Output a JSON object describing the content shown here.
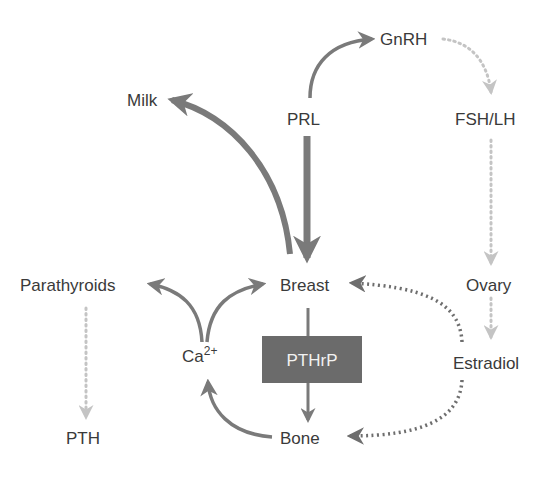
{
  "diagram": {
    "type": "hormonal-regulation-flow",
    "nodes": {
      "gnrh": {
        "label": "GnRH",
        "x": 388,
        "y": 46
      },
      "milk": {
        "label": "Milk",
        "x": 127,
        "y": 105
      },
      "prl": {
        "label": "PRL",
        "x": 287,
        "y": 124
      },
      "fsh_lh": {
        "label": "FSH/LH",
        "x": 455,
        "y": 124
      },
      "parathyroids": {
        "label": "Parathyroids",
        "x": 20,
        "y": 290
      },
      "breast": {
        "label": "Breast",
        "x": 282,
        "y": 290
      },
      "ovary": {
        "label": "Ovary",
        "x": 466,
        "y": 290
      },
      "ca": {
        "label": "Ca",
        "superscript": "2+",
        "x": 182,
        "y": 360
      },
      "pthrp": {
        "label": "PTHrP",
        "x": 262,
        "y": 336,
        "width": 100,
        "height": 47
      },
      "estradiol": {
        "label": "Estradiol",
        "x": 453,
        "y": 368
      },
      "pth": {
        "label": "PTH",
        "x": 66,
        "y": 443
      },
      "bone": {
        "label": "Bone",
        "x": 280,
        "y": 443
      }
    },
    "edges": [
      {
        "from": "PRL",
        "to": "GnRH",
        "style": "solid",
        "weight": "normal"
      },
      {
        "from": "GnRH",
        "to": "FSH/LH",
        "style": "dotted-light"
      },
      {
        "from": "FSH/LH",
        "to": "Ovary",
        "style": "dotted-light"
      },
      {
        "from": "Ovary",
        "to": "Estradiol",
        "style": "dotted-light"
      },
      {
        "from": "Breast",
        "to": "Milk",
        "style": "solid",
        "weight": "thick"
      },
      {
        "from": "PRL",
        "to": "Breast",
        "style": "solid",
        "weight": "thick"
      },
      {
        "from": "Ca2+",
        "to": "Parathyroids",
        "style": "solid",
        "weight": "normal"
      },
      {
        "from": "Ca2+",
        "to": "Breast",
        "style": "solid",
        "weight": "normal"
      },
      {
        "from": "Parathyroids",
        "to": "PTH",
        "style": "dotted-light"
      },
      {
        "from": "Breast",
        "to": "Bone",
        "via": "PTHrP",
        "style": "solid",
        "weight": "normal"
      },
      {
        "from": "Bone",
        "to": "Ca2+",
        "style": "solid",
        "weight": "normal"
      },
      {
        "from": "Estradiol",
        "to": "Breast",
        "style": "dotted-dark"
      },
      {
        "from": "Estradiol",
        "to": "Bone",
        "style": "dotted-dark"
      }
    ],
    "colors": {
      "text": "#3a3a3a",
      "arrow_solid": "#7a7a7a",
      "arrow_dotted_dark": "#6e6e6e",
      "arrow_dotted_light": "#c4c4c4",
      "box_fill": "#6b6b6b",
      "box_text": "#f2f2f2",
      "background": "#ffffff"
    }
  }
}
